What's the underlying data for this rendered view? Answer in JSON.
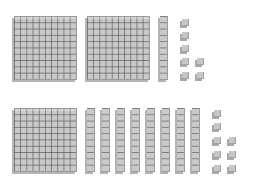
{
  "rows": [
    {
      "name": "top",
      "hundreds": 2,
      "tens": 1,
      "ones": 7,
      "value": 217,
      "flats": [
        {
          "x": 14,
          "y": 16
        },
        {
          "x": 87,
          "y": 16
        }
      ],
      "rods": [
        {
          "x": 160,
          "y": 16
        }
      ],
      "units": [
        {
          "x": 182,
          "y": 19
        },
        {
          "x": 182,
          "y": 32
        },
        {
          "x": 182,
          "y": 45
        },
        {
          "x": 182,
          "y": 58
        },
        {
          "x": 182,
          "y": 72
        },
        {
          "x": 197,
          "y": 58
        },
        {
          "x": 197,
          "y": 72
        }
      ]
    },
    {
      "name": "bottom",
      "hundreds": 1,
      "tens": 8,
      "ones": 8,
      "value": 188,
      "flats": [
        {
          "x": 14,
          "y": 108
        }
      ],
      "rods": [
        {
          "x": 87,
          "y": 108
        },
        {
          "x": 102,
          "y": 108
        },
        {
          "x": 117,
          "y": 108
        },
        {
          "x": 132,
          "y": 108
        },
        {
          "x": 147,
          "y": 108
        },
        {
          "x": 162,
          "y": 108
        },
        {
          "x": 177,
          "y": 108
        },
        {
          "x": 192,
          "y": 108
        }
      ],
      "units": [
        {
          "x": 214,
          "y": 110
        },
        {
          "x": 214,
          "y": 123
        },
        {
          "x": 214,
          "y": 137
        },
        {
          "x": 214,
          "y": 151
        },
        {
          "x": 214,
          "y": 165
        },
        {
          "x": 229,
          "y": 137
        },
        {
          "x": 229,
          "y": 151
        },
        {
          "x": 229,
          "y": 165
        }
      ]
    }
  ],
  "colors": {
    "block": "#c9c9c9",
    "grid": "#5a5a5a",
    "background": "#ffffff"
  }
}
